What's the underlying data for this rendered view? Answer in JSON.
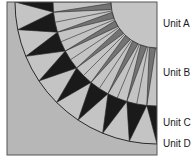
{
  "diagram": {
    "colors": {
      "background": "#b7b7b7",
      "light": "#c4c4c4",
      "medium": "#737373",
      "dark": "#1a1a1a",
      "line": "#2a2a2a"
    },
    "geometry": {
      "square": {
        "x": 7,
        "y": 2,
        "w": 150,
        "h": 153
      },
      "center": {
        "x": 157,
        "y": 2
      },
      "radius_a": 46,
      "radius_b": 104,
      "radius_c": 142,
      "rays_b": 8,
      "spikes_c": 8
    }
  },
  "labels": [
    {
      "id": "unit-a",
      "text": "Unit A",
      "y": 21
    },
    {
      "id": "unit-b",
      "text": "Unit B",
      "y": 70
    },
    {
      "id": "unit-c",
      "text": "Unit C",
      "y": 120
    },
    {
      "id": "unit-d",
      "text": "Unit D",
      "y": 141
    }
  ]
}
